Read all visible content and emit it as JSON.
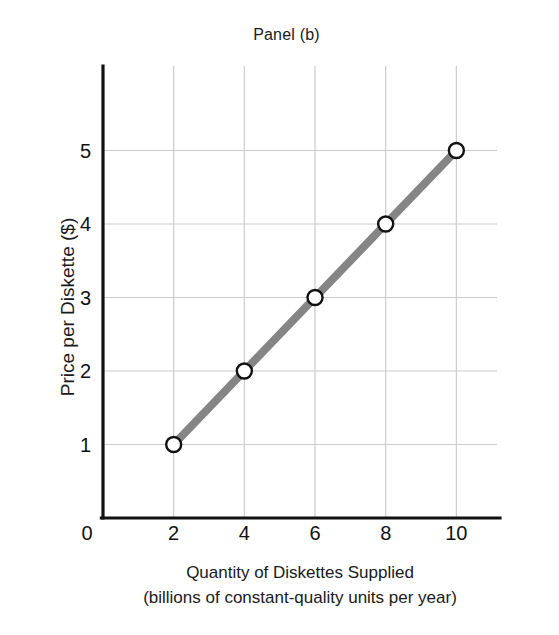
{
  "chart_data": {
    "type": "line",
    "title": "Panel (b)",
    "xlabel": "Quantity of Diskettes Supplied",
    "xlabel_line2": "(billions of constant-quality units per year)",
    "ylabel": "Price per Diskette ($)",
    "x": [
      2,
      4,
      6,
      8,
      10
    ],
    "values": [
      1,
      2,
      3,
      4,
      5
    ],
    "series": [
      {
        "name": "Supply",
        "x": [
          2,
          4,
          6,
          8,
          10
        ],
        "values": [
          1,
          2,
          3,
          4,
          5
        ]
      }
    ],
    "points": [
      {
        "x": 2,
        "y": 1
      },
      {
        "x": 4,
        "y": 2
      },
      {
        "x": 6,
        "y": 3
      },
      {
        "x": 8,
        "y": 4
      },
      {
        "x": 10,
        "y": 5
      }
    ],
    "xlim": [
      0,
      11.15
    ],
    "ylim": [
      0,
      6.15
    ],
    "xticks": [
      0,
      2,
      4,
      6,
      8,
      10
    ],
    "xtick_labels": [
      "0",
      "2",
      "4",
      "6",
      "8",
      "10"
    ],
    "yticks": [
      1,
      2,
      3,
      4,
      5
    ],
    "ytick_labels": [
      "1",
      "2",
      "3",
      "4",
      "5"
    ],
    "origin_label": "0",
    "grid": true,
    "legend": false,
    "legend_position": "none",
    "colors": {
      "line": "#858585",
      "marker_fill": "#ffffff",
      "marker_stroke": "#111111",
      "axis": "#111111",
      "grid": "#cccccc",
      "background": "#ffffff",
      "text": "#1a1a1a"
    },
    "line_width": 8,
    "marker": "circle-open",
    "marker_size": 15
  }
}
